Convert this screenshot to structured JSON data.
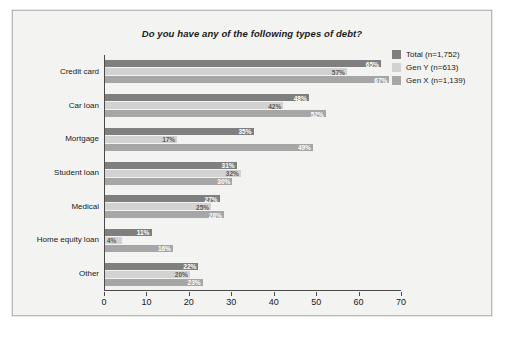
{
  "chart_data": {
    "type": "bar",
    "orientation": "horizontal",
    "title": "Do you have any of the following types of debt?",
    "xlabel": "",
    "ylabel": "",
    "xlim": [
      0,
      70
    ],
    "xticks": [
      0,
      10,
      20,
      30,
      40,
      50,
      60,
      70
    ],
    "grid": false,
    "legend_position": "top-right",
    "value_suffix": "%",
    "categories": [
      "Credit card",
      "Car loan",
      "Mortgage",
      "Student loan",
      "Medical",
      "Home equity loan",
      "Other"
    ],
    "series": [
      {
        "name": "Total (n=1,752)",
        "color": "#7f7f7f",
        "values": [
          65,
          48,
          35,
          31,
          27,
          11,
          22
        ],
        "labels": [
          "65%",
          "48%",
          "35%",
          "31%",
          "27%",
          "11%",
          "22%"
        ]
      },
      {
        "name": "Gen Y (n=613)",
        "color": "#d2d2d2",
        "values": [
          57,
          42,
          17,
          32,
          25,
          4,
          20
        ],
        "labels": [
          "57%",
          "42%",
          "17%",
          "32%",
          "25%",
          "4%",
          "20%"
        ]
      },
      {
        "name": "Gen X (n=1,139)",
        "color": "#a6a6a6",
        "values": [
          67,
          52,
          49,
          30,
          28,
          16,
          23
        ],
        "labels": [
          "67%",
          "52%",
          "49%",
          "30%",
          "28%",
          "16%",
          "23%"
        ]
      }
    ]
  },
  "colors": {
    "page_background": "#ffffff",
    "panel_background": "#f3f3f1",
    "panel_border": "#b9b9b5",
    "axis": "#4a4a4a",
    "text": "#1a1a1a",
    "label_on_bar": "#ffffff",
    "label_on_light_bar": "#5b5b5b"
  }
}
